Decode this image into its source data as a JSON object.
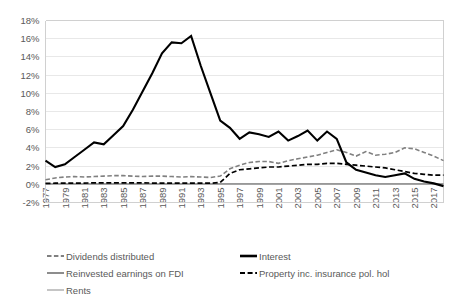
{
  "chart_data": {
    "type": "line",
    "title": "",
    "subtitle": "",
    "xlabel": "",
    "ylabel": "",
    "grid": true,
    "legend_position": "bottom",
    "xlim": [
      1977,
      2018
    ],
    "ylim": [
      -2,
      18
    ],
    "ytick_labels": [
      "18%",
      "16%",
      "14%",
      "12%",
      "10%",
      "8%",
      "6%",
      "4%",
      "2%",
      "0%",
      "-2%"
    ],
    "ytick_values": [
      18,
      16,
      14,
      12,
      10,
      8,
      6,
      4,
      2,
      0,
      -2
    ],
    "xtick_labels": [
      "1977",
      "1979",
      "1981",
      "1983",
      "1985",
      "1987",
      "1989",
      "1991",
      "1993",
      "1995",
      "1997",
      "1999",
      "2001",
      "2003",
      "2005",
      "2007",
      "2009",
      "2011",
      "2013",
      "2015",
      "2017"
    ],
    "xtick_values": [
      1977,
      1979,
      1981,
      1983,
      1985,
      1987,
      1989,
      1991,
      1993,
      1995,
      1997,
      1999,
      2001,
      2003,
      2005,
      2007,
      2009,
      2011,
      2013,
      2015,
      2017
    ],
    "x": [
      1977,
      1978,
      1979,
      1980,
      1981,
      1982,
      1983,
      1984,
      1985,
      1986,
      1987,
      1988,
      1989,
      1990,
      1991,
      1992,
      1993,
      1994,
      1995,
      1996,
      1997,
      1998,
      1999,
      2000,
      2001,
      2002,
      2003,
      2004,
      2005,
      2006,
      2007,
      2008,
      2009,
      2010,
      2011,
      2012,
      2013,
      2014,
      2015,
      2016,
      2017,
      2018
    ],
    "series": [
      {
        "name": "Dividends distributed",
        "color": "#808080",
        "style": "dashed",
        "width": 1.6,
        "values": [
          0.5,
          0.7,
          0.8,
          0.85,
          0.8,
          0.85,
          0.9,
          0.95,
          0.95,
          0.9,
          0.85,
          0.9,
          0.9,
          0.85,
          0.8,
          0.85,
          0.8,
          0.75,
          0.9,
          1.7,
          2.1,
          2.4,
          2.5,
          2.5,
          2.3,
          2.6,
          2.8,
          3.0,
          3.2,
          3.5,
          3.8,
          3.5,
          3.1,
          3.6,
          3.2,
          3.3,
          3.5,
          4.0,
          3.9,
          3.5,
          3.1,
          2.6
        ]
      },
      {
        "name": "Interest",
        "color": "#000000",
        "style": "solid",
        "width": 2.1,
        "values": [
          2.6,
          1.9,
          2.2,
          3.0,
          3.8,
          4.6,
          4.4,
          5.4,
          6.4,
          8.2,
          10.2,
          12.2,
          14.4,
          15.6,
          15.5,
          16.3,
          13.0,
          10.0,
          7.0,
          6.2,
          5.0,
          5.7,
          5.5,
          5.2,
          5.8,
          4.8,
          5.3,
          5.9,
          4.8,
          5.8,
          5.0,
          2.4,
          1.6,
          1.3,
          1.0,
          0.8,
          1.0,
          1.2,
          0.6,
          0.3,
          0.1,
          -0.2
        ]
      },
      {
        "name": "Reinvested earnings on FDI",
        "color": "#808080",
        "style": "solid",
        "width": 1.3,
        "values": [
          0.05,
          0.05,
          0.05,
          0.05,
          0.05,
          0.05,
          0.05,
          0.05,
          0.05,
          0.05,
          0.05,
          0.05,
          0.05,
          0.05,
          0.05,
          0.05,
          0.05,
          0.05,
          0.05,
          0.05,
          0.05,
          0.05,
          0.05,
          0.05,
          0.05,
          0.05,
          0.05,
          0.05,
          0.05,
          0.05,
          0.05,
          0.05,
          0.05,
          0.05,
          0.05,
          0.05,
          0.05,
          0.05,
          0.05,
          0.05,
          0.05,
          0.05
        ]
      },
      {
        "name": "Property inc. insurance pol. hol",
        "color": "#000000",
        "style": "dashed",
        "width": 1.7,
        "values": [
          0.1,
          0.12,
          0.12,
          0.14,
          0.14,
          0.15,
          0.15,
          0.16,
          0.16,
          0.15,
          0.15,
          0.14,
          0.14,
          0.13,
          0.13,
          0.14,
          0.12,
          0.12,
          0.2,
          1.2,
          1.6,
          1.7,
          1.8,
          1.9,
          1.9,
          2.0,
          2.1,
          2.2,
          2.2,
          2.3,
          2.3,
          2.2,
          2.1,
          2.0,
          1.9,
          1.8,
          1.6,
          1.4,
          1.2,
          1.1,
          1.0,
          1.0
        ]
      },
      {
        "name": "Rents",
        "color": "#bfbfbf",
        "style": "solid",
        "width": 1.3,
        "values": [
          0.02,
          0.02,
          0.02,
          0.02,
          0.02,
          0.02,
          0.02,
          0.02,
          0.02,
          0.02,
          0.02,
          0.02,
          0.02,
          0.02,
          0.02,
          0.02,
          0.02,
          0.02,
          0.02,
          0.02,
          0.02,
          0.02,
          0.02,
          0.02,
          0.02,
          0.02,
          0.02,
          0.02,
          0.02,
          0.02,
          0.02,
          0.02,
          0.02,
          0.02,
          0.02,
          0.02,
          0.02,
          0.02,
          0.02,
          0.02,
          0.02,
          0.02
        ]
      }
    ]
  },
  "legend": {
    "items": [
      {
        "label": "Dividends distributed"
      },
      {
        "label": "Interest"
      },
      {
        "label": "Reinvested earnings on FDI"
      },
      {
        "label": "Property inc. insurance pol. hol"
      },
      {
        "label": "Rents"
      }
    ]
  }
}
